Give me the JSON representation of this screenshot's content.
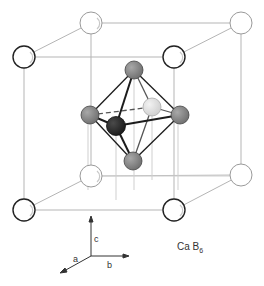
{
  "title": "Ca B6",
  "compound": {
    "prefix": "Ca B",
    "subscript": "6"
  },
  "axes": {
    "a": "a",
    "b": "b",
    "c": "c"
  },
  "colors": {
    "ca_stroke_front": "#222222",
    "ca_stroke_back": "#9a9a9a",
    "b_atom": "#8c8c8c",
    "b_atom_dark": "#2e2e2e",
    "b_atom_light": "#e2e2e2",
    "cube_line": "#b5b5b5",
    "bond": "#1c1c1c"
  },
  "atoms": {
    "ca": [
      {
        "id": "back-top-left",
        "x": 91,
        "y": 23
      },
      {
        "id": "back-top-right",
        "x": 241,
        "y": 23
      },
      {
        "id": "front-top-left",
        "x": 24,
        "y": 57
      },
      {
        "id": "front-top-right",
        "x": 174,
        "y": 57
      },
      {
        "id": "back-bottom-left",
        "x": 91,
        "y": 176
      },
      {
        "id": "back-bottom-right",
        "x": 241,
        "y": 175
      },
      {
        "id": "front-bottom-left",
        "x": 24,
        "y": 210
      },
      {
        "id": "front-bottom-right",
        "x": 174,
        "y": 210
      }
    ],
    "b": [
      {
        "id": "top",
        "x": 134,
        "y": 70
      },
      {
        "id": "left",
        "x": 90,
        "y": 115
      },
      {
        "id": "right",
        "x": 180,
        "y": 115
      },
      {
        "id": "back",
        "x": 152,
        "y": 107
      },
      {
        "id": "front",
        "x": 116,
        "y": 126
      },
      {
        "id": "bottom",
        "x": 133,
        "y": 161
      }
    ]
  }
}
